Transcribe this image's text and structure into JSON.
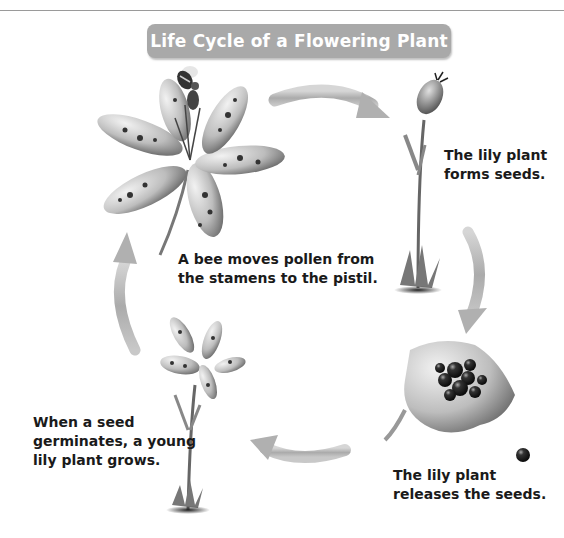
{
  "title": "Life Cycle of a Flowering Plant",
  "stages": [
    {
      "id": "pollination",
      "caption_lines": [
        "A bee moves pollen from",
        "the stamens to the pistil."
      ]
    },
    {
      "id": "seed-formation",
      "caption_lines": [
        "The lily plant",
        "forms seeds."
      ]
    },
    {
      "id": "seed-release",
      "caption_lines": [
        "The lily plant",
        "releases the seeds."
      ]
    },
    {
      "id": "germination",
      "caption_lines": [
        "When a seed",
        "germinates, a young",
        "lily plant grows."
      ]
    }
  ],
  "icons": {
    "bee": "bee-icon",
    "arrow": "cycle-arrow-icon",
    "lily": "lily-flower-icon",
    "seed_pod": "seed-pod-icon",
    "open_pod": "open-seed-pod-icon",
    "seed": "seed-icon"
  },
  "colors": {
    "banner_bg": "#a9a9a9",
    "banner_text": "#ffffff",
    "caption_text": "#1a1a1a",
    "arrow": "#b5b5b5",
    "rule": "#9a9a9a"
  }
}
